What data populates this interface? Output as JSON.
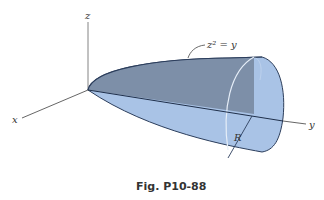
{
  "figure": {
    "caption": "Fig. P10-88",
    "axes": {
      "x_label": "x",
      "y_label": "y",
      "z_label": "z"
    },
    "equation_label": "z² = y",
    "radius_label": "R",
    "colors": {
      "solid_light": "#a9c3e6",
      "solid_dark": "#7d8fa8",
      "outline": "#2c3e5c",
      "axis": "#555555",
      "inner_circle": "#e6eef8"
    }
  }
}
